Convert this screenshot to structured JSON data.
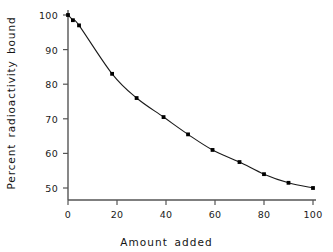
{
  "chart_data": {
    "type": "line",
    "title": "",
    "xlabel": "Amount added",
    "ylabel": "Percent radioactivity bound",
    "xlim": [
      0,
      103
    ],
    "ylim": [
      47,
      101
    ],
    "xticks": [
      0,
      20,
      40,
      60,
      80,
      100
    ],
    "yticks": [
      50,
      60,
      70,
      80,
      90,
      100
    ],
    "xtick_labels": [
      "0",
      "20",
      "40",
      "60",
      "80",
      "100"
    ],
    "ytick_labels": [
      "50",
      "60",
      "70",
      "80",
      "90",
      "100"
    ],
    "grid": false,
    "legend": null,
    "marker": "square",
    "marker_color": "#000000",
    "line_color": "#1a1a1a",
    "axis_color": "#555555",
    "series": [
      {
        "name": "Percent radioactivity bound",
        "x": [
          0,
          2,
          4.5,
          18,
          28,
          39,
          49,
          59,
          70,
          80,
          90,
          100
        ],
        "y": [
          100,
          98.5,
          97,
          83,
          76,
          70.5,
          65.5,
          61,
          57.5,
          54,
          51.5,
          50
        ]
      }
    ]
  },
  "axes": {
    "y_axis_title": "Percent radioactivity bound",
    "x_axis_title": "Amount added"
  }
}
